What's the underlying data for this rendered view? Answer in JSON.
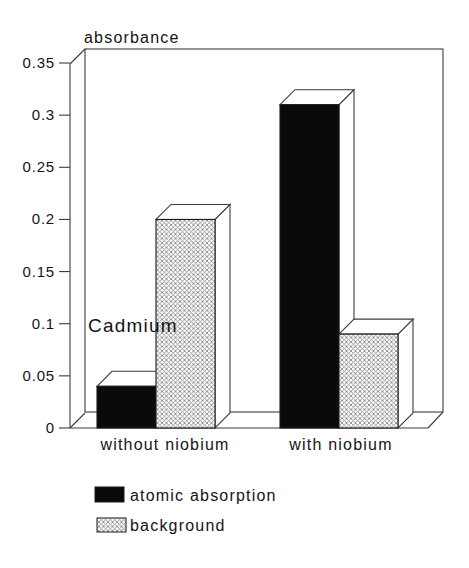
{
  "chart_data": {
    "type": "bar",
    "projection": "3d",
    "title": "absorbance",
    "annotation": "Cadmium",
    "categories": [
      "without niobium",
      "with niobium"
    ],
    "series": [
      {
        "name": "atomic absorption",
        "style": "solid-black",
        "values": [
          0.04,
          0.31
        ]
      },
      {
        "name": "background",
        "style": "hatched",
        "values": [
          0.2,
          0.09
        ]
      }
    ],
    "xlabel": "",
    "ylabel": "absorbance",
    "ylim": [
      0,
      0.35
    ],
    "y_ticks": [
      0,
      0.05,
      0.1,
      0.15,
      0.2,
      0.25,
      0.3,
      0.35
    ],
    "y_tick_labels": [
      "0",
      "0.05",
      "0.1",
      "0.15",
      "0.2",
      "0.25",
      "0.3",
      "0.35"
    ],
    "grid": false,
    "legend_position": "bottom-left",
    "colors": {
      "bar_black": "#0a0a0a",
      "hatch_line": "#8c8c8c",
      "frame_line": "#3d3d3d",
      "background": "#ffffff"
    }
  }
}
